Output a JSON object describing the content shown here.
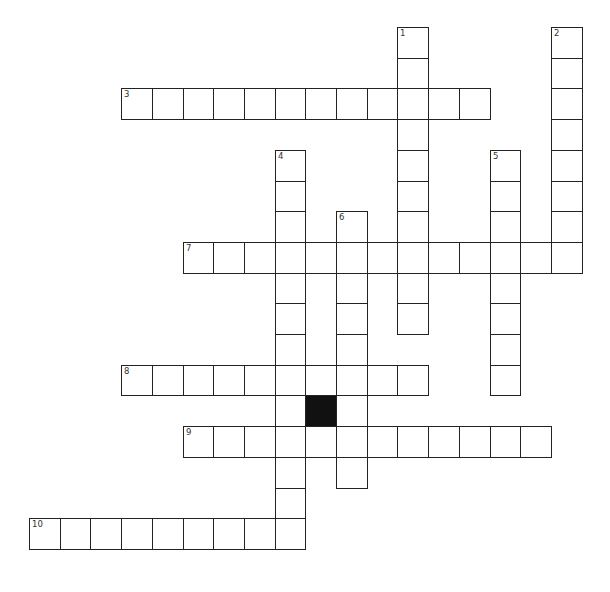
{
  "puzzle": {
    "type": "crossword",
    "cell_size": 30.7,
    "origin": {
      "x": 29,
      "y": 27
    },
    "colors": {
      "border": "#222222",
      "cell": "#ffffff",
      "block": "#111111",
      "number": "#333333"
    },
    "entries": [
      {
        "number": "1",
        "direction": "down",
        "row": 0,
        "col": 12,
        "length": 10
      },
      {
        "number": "2",
        "direction": "down",
        "row": 0,
        "col": 17,
        "length": 8
      },
      {
        "number": "3",
        "direction": "across",
        "row": 2,
        "col": 3,
        "length": 12
      },
      {
        "number": "4",
        "direction": "down",
        "row": 4,
        "col": 8,
        "length": 13
      },
      {
        "number": "5",
        "direction": "down",
        "row": 4,
        "col": 15,
        "length": 8
      },
      {
        "number": "6",
        "direction": "down",
        "row": 6,
        "col": 10,
        "length": 9
      },
      {
        "number": "7",
        "direction": "across",
        "row": 7,
        "col": 5,
        "length": 13
      },
      {
        "number": "8",
        "direction": "across",
        "row": 11,
        "col": 3,
        "length": 10
      },
      {
        "number": "9",
        "direction": "across",
        "row": 13,
        "col": 5,
        "length": 12
      },
      {
        "number": "10",
        "direction": "across",
        "row": 16,
        "col": 0,
        "length": 9
      }
    ],
    "blocks": [
      {
        "row": 12,
        "col": 9
      }
    ]
  }
}
